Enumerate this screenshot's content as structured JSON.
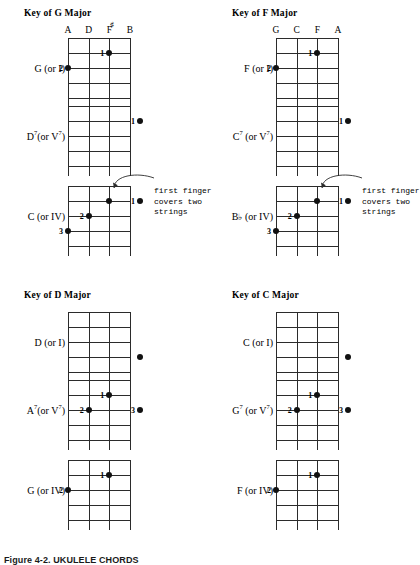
{
  "figure": {
    "caption": "Figure 4-2.  UKULELE CHORDS",
    "annotation_text_line1": "first finger",
    "annotation_text_line2": "covers two",
    "annotation_text_line3": "strings"
  },
  "sections": [
    {
      "id": "key-of-g-major",
      "title": "Key of G Major",
      "string_names": [
        "A",
        "D",
        "F#",
        "B"
      ],
      "string_names_display": [
        "A",
        "D",
        "F",
        "B"
      ],
      "has_sharp_on": 2,
      "chords": [
        {
          "id": "g-major",
          "label": "G (or I)",
          "root": "G",
          "roman": "I",
          "seventh": false,
          "dots": [
            {
              "string": 3,
              "fret": 1,
              "finger": "1"
            },
            {
              "string": 1,
              "fret": 2,
              "finger": "2"
            }
          ]
        },
        {
          "id": "d7",
          "label": "D7(or V7)",
          "root": "D",
          "roman": "V",
          "seventh": true,
          "dots": [
            {
              "string": 5,
              "fret": 1,
              "finger": "1"
            }
          ]
        },
        {
          "id": "c-major",
          "label": "C (or IV)",
          "root": "C",
          "roman": "IV",
          "seventh": false,
          "dots": [
            {
              "string": 3,
              "fret": 1,
              "finger": ""
            },
            {
              "string": 5,
              "fret": 1,
              "finger": "1"
            },
            {
              "string": 2,
              "fret": 2,
              "finger": "2"
            },
            {
              "string": 1,
              "fret": 3,
              "finger": "3"
            }
          ],
          "annotation": true
        }
      ]
    },
    {
      "id": "key-of-f-major",
      "title": "Key of F Major",
      "string_names": [
        "G",
        "C",
        "F",
        "A"
      ],
      "string_names_display": [
        "G",
        "C",
        "F",
        "A"
      ],
      "has_sharp_on": -1,
      "chords": [
        {
          "id": "f-major",
          "label": "F (or I)",
          "root": "F",
          "roman": "I",
          "seventh": false,
          "dots": [
            {
              "string": 3,
              "fret": 1,
              "finger": "1"
            },
            {
              "string": 1,
              "fret": 2,
              "finger": "2"
            }
          ]
        },
        {
          "id": "c7",
          "label": "C7 (or V7)",
          "root": "C",
          "roman": "V",
          "seventh": true,
          "dots": [
            {
              "string": 5,
              "fret": 1,
              "finger": "1"
            }
          ]
        },
        {
          "id": "b-flat-major",
          "label": "Bb (or IV)",
          "root": "Bb",
          "roman": "IV",
          "seventh": false,
          "dots": [
            {
              "string": 3,
              "fret": 1,
              "finger": ""
            },
            {
              "string": 5,
              "fret": 1,
              "finger": "1"
            },
            {
              "string": 2,
              "fret": 2,
              "finger": "2"
            },
            {
              "string": 1,
              "fret": 3,
              "finger": "3"
            }
          ],
          "annotation": true
        }
      ]
    },
    {
      "id": "key-of-d-major",
      "title": "Key of D Major",
      "string_names": [],
      "string_names_display": [],
      "has_sharp_on": -1,
      "chords": [
        {
          "id": "d-major",
          "label": "D (or I)",
          "root": "D",
          "roman": "I",
          "seventh": false,
          "dots": [
            {
              "string": 5,
              "fret": 3,
              "finger": ""
            }
          ]
        },
        {
          "id": "a7",
          "label": "A7(or V7)",
          "root": "A",
          "roman": "V",
          "seventh": true,
          "dots": [
            {
              "string": 3,
              "fret": 1,
              "finger": "1"
            },
            {
              "string": 2,
              "fret": 2,
              "finger": "2"
            },
            {
              "string": 5,
              "fret": 2,
              "finger": "3"
            }
          ]
        },
        {
          "id": "g-major-iv",
          "label": "G (or IV)",
          "root": "G",
          "roman": "IV",
          "seventh": false,
          "dots": [
            {
              "string": 3,
              "fret": 1,
              "finger": "1"
            },
            {
              "string": 1,
              "fret": 2,
              "finger": "2"
            }
          ]
        }
      ]
    },
    {
      "id": "key-of-c-major",
      "title": "Key of C Major",
      "string_names": [],
      "string_names_display": [],
      "has_sharp_on": -1,
      "chords": [
        {
          "id": "c-major-i",
          "label": "C (or I)",
          "root": "C",
          "roman": "I",
          "seventh": false,
          "dots": [
            {
              "string": 5,
              "fret": 3,
              "finger": ""
            }
          ]
        },
        {
          "id": "g7",
          "label": "G7 (or V7)",
          "root": "G",
          "roman": "V",
          "seventh": true,
          "dots": [
            {
              "string": 3,
              "fret": 1,
              "finger": "1"
            },
            {
              "string": 2,
              "fret": 2,
              "finger": "2"
            },
            {
              "string": 5,
              "fret": 2,
              "finger": "3"
            }
          ]
        },
        {
          "id": "f-major-iv",
          "label": "F (or IV)",
          "root": "F",
          "roman": "IV",
          "seventh": false,
          "dots": [
            {
              "string": 3,
              "fret": 1,
              "finger": "1"
            },
            {
              "string": 1,
              "fret": 2,
              "finger": "2"
            }
          ]
        }
      ]
    }
  ],
  "layout": {
    "grid_width": 62,
    "grid_height": 60,
    "n_strings": 4,
    "n_frets": 4,
    "section_origins": [
      [
        8,
        8
      ],
      [
        216,
        8
      ],
      [
        8,
        290
      ],
      [
        216,
        290
      ]
    ],
    "chord_offsets_with_names": [
      [
        60,
        30
      ],
      [
        60,
        98
      ],
      [
        60,
        178
      ]
    ],
    "chord_offsets_plain": [
      [
        60,
        22
      ],
      [
        60,
        90
      ],
      [
        60,
        170
      ]
    ]
  },
  "colors": {
    "ink": "#111111",
    "grid": "#2b2b2b",
    "background": "#ffffff"
  }
}
